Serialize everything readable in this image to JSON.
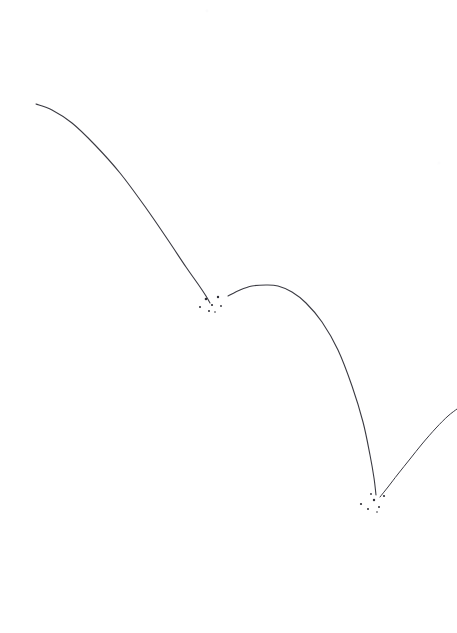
{
  "figure": {
    "background_color": "#ffffff",
    "stroke_color": "#3a3a42",
    "speck_color": "#2e2e36",
    "faint_speck_color": "#e8e8ec",
    "width": 457,
    "height": 633
  },
  "chart_data": {
    "type": "line",
    "xlabel": "",
    "ylabel": "",
    "xlim": [
      0,
      457
    ],
    "ylim": [
      633,
      0
    ],
    "grid": false,
    "legend": "none",
    "annotations": [
      "first bounce impact at (211, 303)",
      "second bounce impact at (375, 499)"
    ],
    "series": [
      {
        "name": "arc-1-incoming",
        "comment": "First descending arc entering from upper left, tapered start",
        "stroke_width": 1.1,
        "x": [
          36,
          52,
          72,
          95,
          120,
          146,
          168,
          186,
          198,
          206,
          210
        ],
        "y": [
          104,
          110,
          123,
          145,
          173,
          208,
          240,
          267,
          284,
          296,
          303
        ]
      },
      {
        "name": "arc-2-rebound",
        "comment": "Second arc: rebound from first bounce, apex then steep fall",
        "stroke_width": 1.1,
        "x": [
          228,
          240,
          252,
          266,
          278,
          292,
          306,
          322,
          338,
          352,
          363,
          370,
          374,
          376
        ],
        "y": [
          296,
          290,
          286,
          285,
          286,
          292,
          303,
          322,
          350,
          386,
          422,
          455,
          478,
          495
        ]
      },
      {
        "name": "arc-3-outgoing",
        "comment": "Third arc: rebound from second bounce, exits right edge",
        "stroke_width": 1.0,
        "x": [
          380,
          388,
          398,
          410,
          422,
          436,
          448,
          457
        ],
        "y": [
          497,
          487,
          474,
          459,
          444,
          428,
          416,
          409
        ]
      }
    ],
    "impact_clusters": [
      {
        "name": "bounce-1",
        "center_x": 211,
        "center_y": 303,
        "specks": [
          {
            "x": 200,
            "y": 307,
            "r": 1.0
          },
          {
            "x": 206,
            "y": 299,
            "r": 1.3
          },
          {
            "x": 212,
            "y": 305,
            "r": 1.1
          },
          {
            "x": 209,
            "y": 311,
            "r": 1.0
          },
          {
            "x": 218,
            "y": 297,
            "r": 1.2
          },
          {
            "x": 221,
            "y": 306,
            "r": 0.9
          },
          {
            "x": 215,
            "y": 312,
            "r": 0.8
          }
        ]
      },
      {
        "name": "bounce-2",
        "center_x": 375,
        "center_y": 499,
        "specks": [
          {
            "x": 361,
            "y": 504,
            "r": 1.1
          },
          {
            "x": 368,
            "y": 509,
            "r": 1.0
          },
          {
            "x": 374,
            "y": 500,
            "r": 1.2
          },
          {
            "x": 371,
            "y": 494,
            "r": 0.9
          },
          {
            "x": 379,
            "y": 507,
            "r": 1.0
          },
          {
            "x": 384,
            "y": 496,
            "r": 1.1
          },
          {
            "x": 377,
            "y": 512,
            "r": 0.8
          }
        ]
      }
    ],
    "stray_specks": [
      {
        "x": 207,
        "y": 11,
        "r": 1.4,
        "opacity": 0.18
      },
      {
        "x": 439,
        "y": 163,
        "r": 1.6,
        "opacity": 0.12
      }
    ]
  }
}
